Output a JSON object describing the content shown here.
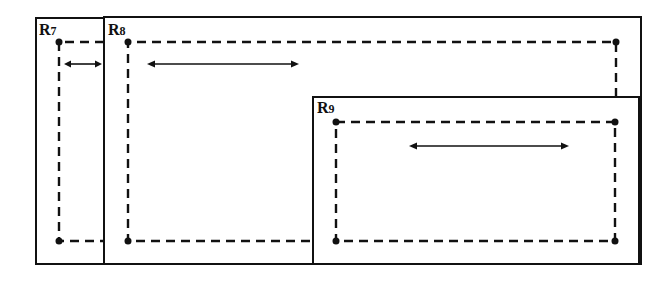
{
  "diagram": {
    "regions": [
      {
        "id": "R7",
        "label_main": "R",
        "label_sub": "7",
        "box": {
          "x1": 36,
          "y1": 18,
          "x2": 104,
          "y2": 264
        },
        "corners": [
          [
            59,
            42
          ],
          [
            59,
            241
          ]
        ],
        "dashed_path": [
          [
            104,
            42
          ],
          [
            59,
            42
          ],
          [
            59,
            241
          ],
          [
            104,
            241
          ]
        ],
        "arrow": {
          "x1": 64,
          "x2": 102,
          "y": 64,
          "direction": "both"
        }
      },
      {
        "id": "R8",
        "label_main": "R",
        "label_sub": "8",
        "box": {
          "x1": 104,
          "y1": 17,
          "x2": 641,
          "y2": 264
        },
        "corners": [
          [
            128,
            42
          ],
          [
            616,
            42
          ],
          [
            128,
            241
          ]
        ],
        "dashed_path": [
          [
            616,
            97
          ],
          [
            616,
            42
          ],
          [
            128,
            42
          ],
          [
            128,
            241
          ],
          [
            313,
            241
          ]
        ],
        "arrow": {
          "x1": 147,
          "x2": 299,
          "y": 64,
          "direction": "both"
        }
      },
      {
        "id": "R9",
        "label_main": "R",
        "label_sub": "9",
        "box": {
          "x1": 313,
          "y1": 97,
          "x2": 639,
          "y2": 264
        },
        "corners": [
          [
            336,
            122
          ],
          [
            615,
            122
          ],
          [
            336,
            241
          ],
          [
            615,
            241
          ]
        ],
        "dashed_path": [
          [
            336,
            122
          ],
          [
            615,
            122
          ],
          [
            615,
            241
          ],
          [
            336,
            241
          ],
          [
            336,
            122
          ]
        ],
        "arrow": {
          "x1": 409,
          "x2": 569,
          "y": 146,
          "direction": "both"
        }
      }
    ],
    "colors": {
      "stroke": "#111111",
      "background": "#ffffff"
    }
  }
}
